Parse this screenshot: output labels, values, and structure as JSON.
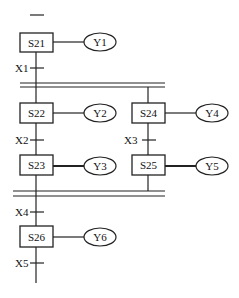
{
  "diagram": {
    "type": "SFC (sequential function chart) with parallel branches",
    "steps": [
      {
        "id": "S21",
        "output": "Y1"
      },
      {
        "id": "S22",
        "output": "Y2"
      },
      {
        "id": "S23",
        "output": "Y3"
      },
      {
        "id": "S24",
        "output": "Y4"
      },
      {
        "id": "S25",
        "output": "Y5"
      },
      {
        "id": "S26",
        "output": "Y6"
      }
    ],
    "transitions": [
      {
        "label": "X1"
      },
      {
        "label": "X2"
      },
      {
        "label": "X3"
      },
      {
        "label": "X4"
      },
      {
        "label": "X5"
      }
    ]
  }
}
